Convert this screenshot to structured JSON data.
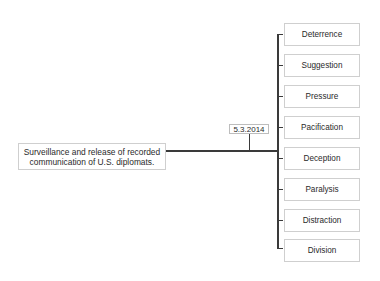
{
  "diagram": {
    "source_event": {
      "line1": "Surveillance and release of recorded",
      "line2": "communication of U.S. diplomats."
    },
    "date_label": "5.3.2014",
    "outcomes": [
      {
        "label": "Deterrence"
      },
      {
        "label": "Suggestion"
      },
      {
        "label": "Pressure"
      },
      {
        "label": "Pacification"
      },
      {
        "label": "Deception"
      },
      {
        "label": "Paralysis"
      },
      {
        "label": "Distraction"
      },
      {
        "label": "Division"
      }
    ]
  }
}
